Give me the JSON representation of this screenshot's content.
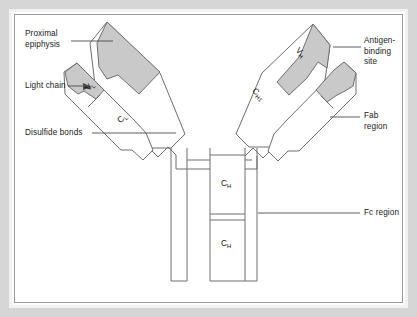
{
  "figure": {
    "colors": {
      "domain_fill": "#c9c9c9",
      "chain_outline": "#6e6e6e",
      "text": "#1a1a1a",
      "leader_line": "#4a4a4a",
      "frame_gray": "#d6d6d6",
      "inner_border": "#9a9a9a",
      "background": "#ffffff"
    }
  },
  "labels": {
    "left": [
      {
        "id": "proximal-epiphysis",
        "text": "Proximal\nepiphysis"
      },
      {
        "id": "light-chain",
        "text": "Light chain"
      },
      {
        "id": "disulfide-bonds",
        "text": "Disulfide bonds"
      }
    ],
    "right": [
      {
        "id": "antigen-binding-site",
        "text": "Antigen-\nbinding\nsite"
      },
      {
        "id": "fab-region",
        "text": "Fab\nregion"
      },
      {
        "id": "fc-region",
        "text": "Fc region"
      }
    ]
  },
  "domains": [
    {
      "id": "vl-left",
      "base": "V",
      "sub": "L"
    },
    {
      "id": "cl-left",
      "base": "C",
      "sub": "L"
    },
    {
      "id": "vh-right",
      "base": "V",
      "sub": "H"
    },
    {
      "id": "ch1-right",
      "base": "C",
      "sub": "H1"
    },
    {
      "id": "ch-upper",
      "base": "C",
      "sub": "H"
    },
    {
      "id": "ch-lower",
      "base": "C",
      "sub": "H"
    }
  ]
}
